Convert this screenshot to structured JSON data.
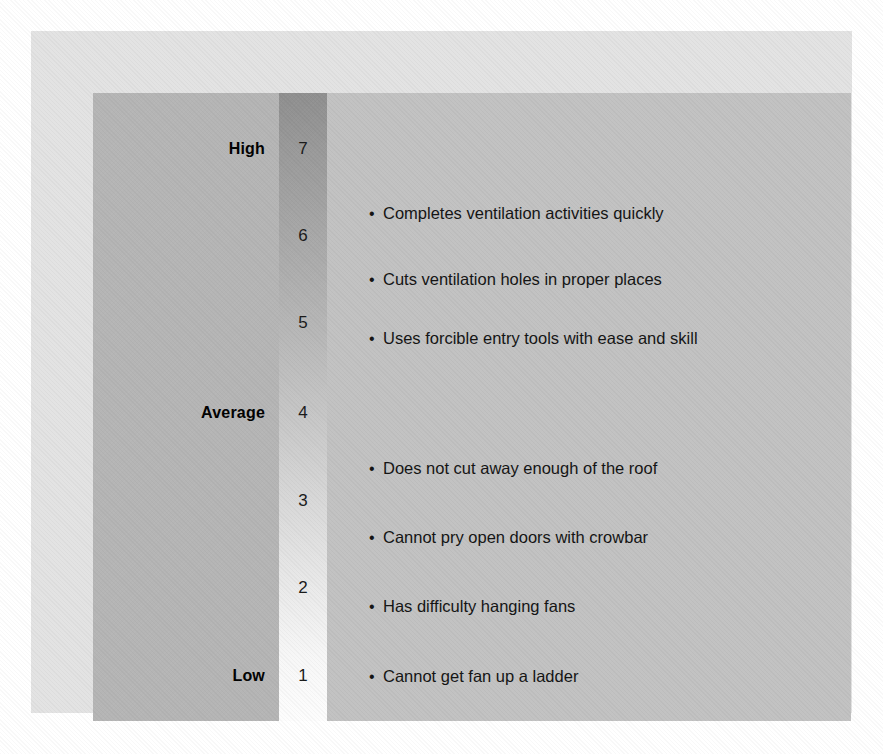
{
  "chart_data": {
    "type": "table",
    "title": "",
    "xlabel": "",
    "ylabel": "",
    "scale_name": "Behaviorally Anchored Rating Scale",
    "axis_range": [
      1,
      7
    ],
    "grid": false,
    "legend_position": "none",
    "scale_numbers": [
      7,
      6,
      5,
      4,
      3,
      2,
      1
    ],
    "anchors": [
      {
        "label": "High",
        "value": 7
      },
      {
        "label": "Average",
        "value": 4
      },
      {
        "label": "Low",
        "value": 1
      }
    ],
    "descriptors": [
      {
        "text": "Completes ventilation activities quickly",
        "value": 6.4
      },
      {
        "text": "Cuts ventilation holes in proper places",
        "value": 5.6
      },
      {
        "text": "Uses forcible entry tools with ease and skill",
        "value": 4.9
      },
      {
        "text": "Does not cut away enough of the roof",
        "value": 3.4
      },
      {
        "text": "Cannot pry open doors with crowbar",
        "value": 2.7
      },
      {
        "text": "Has difficulty hanging fans",
        "value": 2.0
      },
      {
        "text": "Cannot get fan up a ladder",
        "value": 1.0
      }
    ],
    "colors": {
      "page_background": "#ffffff",
      "outer_panel": "#e3e3e3",
      "anchor_column": "#b5b5b5",
      "descriptor_column": "#c2c2c2",
      "gradient_top": "#8f8f8f",
      "gradient_bottom": "#fdfdfd",
      "text": "#141414"
    }
  },
  "scale": {
    "numbers": [
      {
        "label": "7",
        "top": 118
      },
      {
        "label": "6",
        "top": 205
      },
      {
        "label": "5",
        "top": 292
      },
      {
        "label": "4",
        "top": 382
      },
      {
        "label": "3",
        "top": 470
      },
      {
        "label": "2",
        "top": 557
      },
      {
        "label": "1",
        "top": 645
      }
    ],
    "anchors": [
      {
        "label": "High",
        "top": 118
      },
      {
        "label": "Average",
        "top": 382
      },
      {
        "label": "Low",
        "top": 645
      }
    ],
    "descriptors": [
      {
        "bullet": "•",
        "text": "Completes ventilation activities quickly",
        "top": 182
      },
      {
        "bullet": "•",
        "text": "Cuts ventilation holes in proper places",
        "top": 248
      },
      {
        "bullet": "•",
        "text": "Uses forcible entry tools with ease and skill",
        "top": 307
      },
      {
        "bullet": "•",
        "text": "Does not cut away enough of the roof",
        "top": 437
      },
      {
        "bullet": "•",
        "text": "Cannot pry open doors with crowbar",
        "top": 506
      },
      {
        "bullet": "•",
        "text": "Has difficulty hanging fans",
        "top": 575
      },
      {
        "bullet": "•",
        "text": "Cannot get fan up a ladder",
        "top": 645
      }
    ]
  }
}
